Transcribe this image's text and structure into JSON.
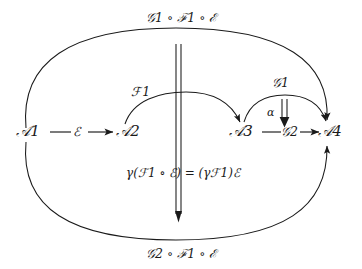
{
  "diagram": {
    "background_color": "#ffffff",
    "stroke_color": "#1a1a1a",
    "text_color": "#1a1a1a",
    "nodes": [
      {
        "id": "A1",
        "label": "ᴬ1",
        "text": "A1",
        "x": 30,
        "y": 132
      },
      {
        "id": "A2",
        "label": "A2",
        "text": "A2",
        "x": 130,
        "y": 132
      },
      {
        "id": "A3",
        "label": "A3",
        "text": "A3",
        "x": 243,
        "y": 132
      },
      {
        "id": "A4",
        "label": "A4",
        "text": "A4",
        "x": 332,
        "y": 132
      }
    ],
    "edges": [
      {
        "id": "e-A1-A2",
        "label": "E",
        "from": "A1",
        "to": "A2"
      },
      {
        "id": "e-A3-A4",
        "label": "G2",
        "from": "A3",
        "to": "A4"
      }
    ],
    "arcs": [
      {
        "id": "arc-F1",
        "label": "F1",
        "from": "A2",
        "to": "A3"
      },
      {
        "id": "arc-G1",
        "label": "G1",
        "from": "A3",
        "to": "A4"
      },
      {
        "id": "arc-top",
        "label": "G1 ◊ F1 ◊ E",
        "from": "A1",
        "to": "A4"
      },
      {
        "id": "arc-bottom",
        "label": "G2 ◊ F1 ◊ E",
        "from": "A1",
        "to": "A4"
      }
    ],
    "two_cells": [
      {
        "id": "cell-alpha",
        "label": "a"
      },
      {
        "id": "cell-gamma",
        "label": "g(F1 ◊ E) = (gF1)E"
      }
    ],
    "labels": {
      "node_a1": "𝒜1",
      "node_a2": "𝒜2",
      "node_a3": "𝒜3",
      "node_a4": "𝒜4",
      "edge_epsilon": "ℰ",
      "edge_g2": "𝒢2",
      "arc_f1": "ℱ 1",
      "arc_g1": "𝒢1",
      "top_composite": "𝒢1 ∘ ℱ 1 ∘ ℰ",
      "bottom_composite": "𝒢2 ∘ ℱ 1 ∘ ℰ",
      "alpha": "α",
      "gamma_equation": "γ(ℱ 1 ∘ ℰ) = (γℱ 1)ℰ"
    }
  }
}
